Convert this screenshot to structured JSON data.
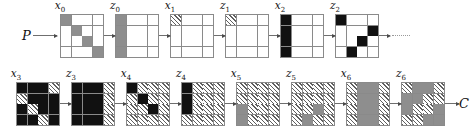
{
  "figure": {
    "type": "state-transition-chain-diagram",
    "grid_size": 4,
    "cell_styles": {
      "white": "empty cell",
      "gray": "gray filled cell",
      "black": "black filled cell",
      "hatch": "diagonally hatched cell"
    },
    "colors": {
      "gray": "#8e8e8e",
      "black": "#111111",
      "hatch_line": "#5f5f5f",
      "grid_line": "#8a8a8a",
      "arrow": "#6f6f6f",
      "background": "#ffffff"
    }
  },
  "endpoints": {
    "input_label": "P",
    "output_label": "C"
  },
  "top_row": {
    "continuation": "dotted",
    "blocks": [
      {
        "label": "x",
        "sub": "0",
        "name": "grid-x0",
        "cells": [
          [
            "g",
            "w",
            "w",
            "w"
          ],
          [
            "w",
            "g",
            "w",
            "w"
          ],
          [
            "w",
            "w",
            "g",
            "w"
          ],
          [
            "w",
            "w",
            "w",
            "g"
          ]
        ]
      },
      {
        "label": "z",
        "sub": "0",
        "name": "grid-z0",
        "cells": [
          [
            "g",
            "w",
            "w",
            "w"
          ],
          [
            "g",
            "w",
            "w",
            "w"
          ],
          [
            "g",
            "w",
            "w",
            "w"
          ],
          [
            "g",
            "w",
            "w",
            "w"
          ]
        ]
      },
      {
        "label": "x",
        "sub": "1",
        "name": "grid-x1",
        "cells": [
          [
            "h",
            "w",
            "w",
            "w"
          ],
          [
            "w",
            "w",
            "w",
            "w"
          ],
          [
            "w",
            "w",
            "w",
            "w"
          ],
          [
            "w",
            "w",
            "w",
            "w"
          ]
        ]
      },
      {
        "label": "z",
        "sub": "1",
        "name": "grid-z1",
        "cells": [
          [
            "h",
            "w",
            "w",
            "w"
          ],
          [
            "w",
            "w",
            "w",
            "w"
          ],
          [
            "w",
            "w",
            "w",
            "w"
          ],
          [
            "w",
            "w",
            "w",
            "w"
          ]
        ]
      },
      {
        "label": "x",
        "sub": "2",
        "name": "grid-x2",
        "cells": [
          [
            "k",
            "w",
            "w",
            "w"
          ],
          [
            "k",
            "w",
            "w",
            "w"
          ],
          [
            "k",
            "w",
            "w",
            "w"
          ],
          [
            "k",
            "w",
            "w",
            "w"
          ]
        ]
      },
      {
        "label": "z",
        "sub": "2",
        "name": "grid-z2",
        "cells": [
          [
            "k",
            "w",
            "w",
            "w"
          ],
          [
            "w",
            "w",
            "w",
            "k"
          ],
          [
            "w",
            "w",
            "k",
            "w"
          ],
          [
            "w",
            "k",
            "w",
            "w"
          ]
        ]
      }
    ]
  },
  "bottom_row": {
    "blocks": [
      {
        "label": "x",
        "sub": "3",
        "name": "grid-x3",
        "cells": [
          [
            "k",
            "k",
            "k",
            "h"
          ],
          [
            "h",
            "k",
            "k",
            "k"
          ],
          [
            "k",
            "h",
            "k",
            "k"
          ],
          [
            "k",
            "k",
            "h",
            "k"
          ]
        ]
      },
      {
        "label": "z",
        "sub": "3",
        "name": "grid-z3",
        "cells": [
          [
            "k",
            "k",
            "k",
            "h"
          ],
          [
            "k",
            "k",
            "k",
            "h"
          ],
          [
            "k",
            "k",
            "k",
            "h"
          ],
          [
            "k",
            "k",
            "k",
            "h"
          ]
        ]
      },
      {
        "label": "x",
        "sub": "4",
        "name": "grid-x4",
        "cells": [
          [
            "k",
            "h",
            "h",
            "h"
          ],
          [
            "h",
            "k",
            "h",
            "h"
          ],
          [
            "h",
            "h",
            "k",
            "h"
          ],
          [
            "h",
            "h",
            "h",
            "h"
          ]
        ]
      },
      {
        "label": "z",
        "sub": "4",
        "name": "grid-z4",
        "cells": [
          [
            "k",
            "h",
            "h",
            "h"
          ],
          [
            "k",
            "h",
            "h",
            "h"
          ],
          [
            "k",
            "h",
            "h",
            "h"
          ],
          [
            "h",
            "h",
            "h",
            "h"
          ]
        ]
      },
      {
        "label": "x",
        "sub": "5",
        "name": "grid-x5",
        "cells": [
          [
            "h",
            "h",
            "h",
            "h"
          ],
          [
            "h",
            "h",
            "h",
            "h"
          ],
          [
            "g",
            "h",
            "h",
            "h"
          ],
          [
            "g",
            "h",
            "h",
            "h"
          ]
        ]
      },
      {
        "label": "z",
        "sub": "5",
        "name": "grid-z5",
        "cells": [
          [
            "h",
            "h",
            "h",
            "h"
          ],
          [
            "h",
            "h",
            "h",
            "h"
          ],
          [
            "h",
            "h",
            "g",
            "h"
          ],
          [
            "h",
            "g",
            "h",
            "h"
          ]
        ]
      },
      {
        "label": "x",
        "sub": "6",
        "name": "grid-x6",
        "cells": [
          [
            "h",
            "g",
            "g",
            "h"
          ],
          [
            "h",
            "g",
            "g",
            "h"
          ],
          [
            "h",
            "g",
            "g",
            "h"
          ],
          [
            "h",
            "g",
            "g",
            "h"
          ]
        ]
      },
      {
        "label": "z",
        "sub": "6",
        "name": "grid-z6",
        "cells": [
          [
            "h",
            "g",
            "g",
            "h"
          ],
          [
            "g",
            "g",
            "h",
            "h"
          ],
          [
            "g",
            "h",
            "h",
            "g"
          ],
          [
            "h",
            "h",
            "g",
            "g"
          ]
        ]
      }
    ]
  }
}
